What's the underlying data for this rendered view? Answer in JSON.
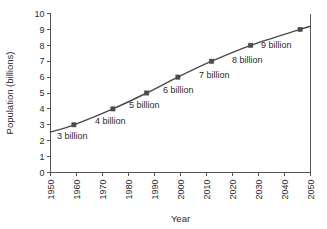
{
  "chart_data": {
    "type": "line",
    "title": "",
    "xlabel": "Year",
    "ylabel": "Population (billions)",
    "xlim": [
      1950,
      2050
    ],
    "ylim": [
      0,
      10
    ],
    "xticks": [
      "1950",
      "1960",
      "1970",
      "1980",
      "1990",
      "2000",
      "2010",
      "2020",
      "2030",
      "2040",
      "2050"
    ],
    "yticks": [
      "0",
      "1",
      "2",
      "3",
      "4",
      "5",
      "6",
      "7",
      "8",
      "9",
      "10"
    ],
    "grid": false,
    "legend": "none",
    "xtick_rotation": -90,
    "series": [
      {
        "name": "World population",
        "x": [
          1950,
          1959,
          1974,
          1987,
          1999,
          2012,
          2027,
          2046,
          2050
        ],
        "values": [
          2.55,
          3.0,
          4.0,
          5.0,
          6.0,
          7.0,
          8.0,
          9.0,
          9.2
        ]
      }
    ],
    "markers": [
      {
        "x": 1959,
        "y": 3.0,
        "label": "3 billion"
      },
      {
        "x": 1974,
        "y": 4.0,
        "label": "4 billion"
      },
      {
        "x": 1987,
        "y": 5.0,
        "label": "5 billion"
      },
      {
        "x": 1999,
        "y": 6.0,
        "label": "6 billion"
      },
      {
        "x": 2012,
        "y": 7.0,
        "label": "7 billion"
      },
      {
        "x": 2027,
        "y": 8.0,
        "label": "8 billion"
      },
      {
        "x": 2046,
        "y": 9.0,
        "label": "9 billion"
      }
    ],
    "annotations": [
      {
        "text": "3 billion",
        "x_px": 57,
        "y_px": 139
      },
      {
        "text": "4 billion",
        "x_px": 95,
        "y_px": 124
      },
      {
        "text": "5 billion",
        "x_px": 129,
        "y_px": 108
      },
      {
        "text": "6 billion",
        "x_px": 163,
        "y_px": 93
      },
      {
        "text": "7 billion",
        "x_px": 199,
        "y_px": 78
      },
      {
        "text": "8 billion",
        "x_px": 232,
        "y_px": 63
      },
      {
        "text": "9 billion",
        "x_px": 261,
        "y_px": 48
      }
    ],
    "colors": {
      "line": "#4a4a4a",
      "marker": "#4a4a4a",
      "axis": "#555555",
      "text": "#2b2b2b",
      "background": "#ffffff"
    }
  }
}
